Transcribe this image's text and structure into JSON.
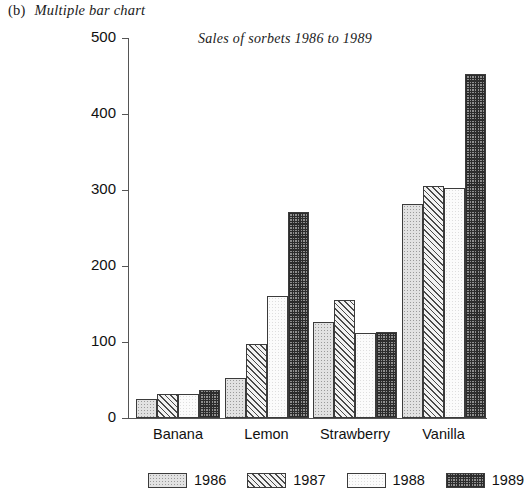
{
  "caption": {
    "index": "(b)",
    "text": "Multiple bar chart"
  },
  "chart_data": {
    "type": "bar",
    "title": "Sales of sorbets 1986 to 1989",
    "xlabel": "",
    "ylabel": "",
    "ylim": [
      0,
      500
    ],
    "yticks": [
      0,
      100,
      200,
      300,
      400,
      500
    ],
    "grid": false,
    "legend_position": "bottom",
    "categories": [
      "Banana",
      "Lemon",
      "Strawberry",
      "Vanilla"
    ],
    "series": [
      {
        "name": "1986",
        "values": [
          25,
          52,
          126,
          282
        ],
        "pattern": "light-dotted"
      },
      {
        "name": "1987",
        "values": [
          32,
          98,
          155,
          305
        ],
        "pattern": "diagonal-hatch"
      },
      {
        "name": "1988",
        "values": [
          32,
          160,
          112,
          303
        ],
        "pattern": "blank-white"
      },
      {
        "name": "1989",
        "values": [
          37,
          271,
          113,
          452
        ],
        "pattern": "dark-checker"
      }
    ]
  }
}
